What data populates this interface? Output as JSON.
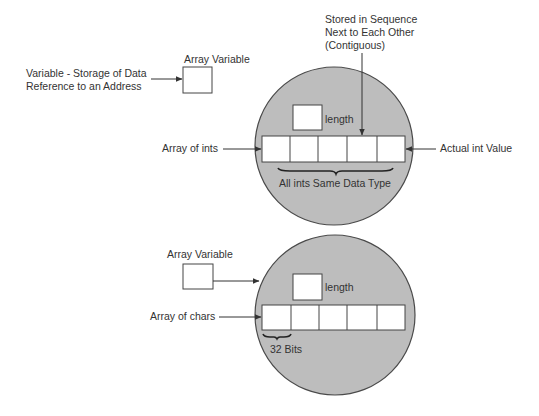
{
  "colors": {
    "background": "#ffffff",
    "circle_fill": "#bdbdbd",
    "circle_stroke": "#4a4a4a",
    "box_fill": "#ffffff",
    "line": "#333333",
    "text": "#333333"
  },
  "top": {
    "array_variable_label": "Array Variable",
    "variable_note_line1": "Variable - Storage of Data",
    "variable_note_line2": "Reference to an Address",
    "contiguous_line1": "Stored in Sequence",
    "contiguous_line2": "Next to Each Other",
    "contiguous_line3": "(Contiguous)",
    "length_label": "length",
    "array_label": "Array of ints",
    "value_label": "Actual int Value",
    "same_type_label": "All ints Same Data Type",
    "cell_count": 5
  },
  "bottom": {
    "array_variable_label": "Array Variable",
    "length_label": "length",
    "array_label": "Array of chars",
    "bits_label": "32 Bits",
    "cell_count": 5
  }
}
